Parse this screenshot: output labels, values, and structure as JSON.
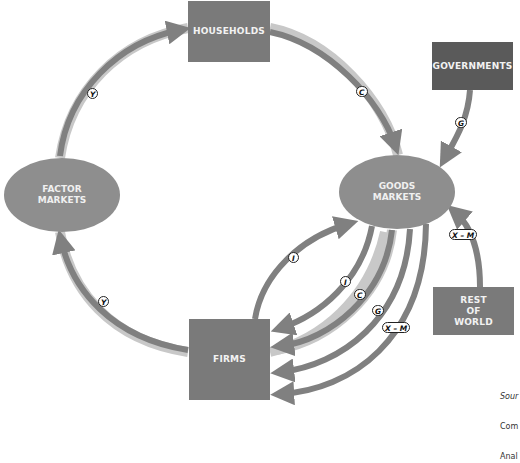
{
  "diagram": {
    "type": "circular-flow",
    "nodes": {
      "households": "HOUSEHOLDS",
      "governments": "GOVERNMENTS",
      "factor_markets": [
        "FACTOR",
        "MARKETS"
      ],
      "goods_markets": [
        "GOODS",
        "MARKETS"
      ],
      "firms": "FIRMS",
      "rest_of_world": [
        "REST",
        "OF",
        "WORLD"
      ]
    },
    "flow_labels": {
      "y_top": "Y",
      "y_bottom": "Y",
      "c_top": "C",
      "g_top": "G",
      "x_m_right": "X – M",
      "i_outer": "I",
      "i_inner": "I",
      "c_bottom": "C",
      "g_bottom": "G",
      "x_m_bottom": "X – M"
    },
    "source": {
      "line1": "Sour",
      "line2": "Com",
      "line3": "Anal"
    },
    "colors": {
      "box": "#7a7a7a",
      "box_dark": "#5a5a5a",
      "oval": "#8e8e8e",
      "arrow": "#808080",
      "arrow_halo": "#c8c8c8"
    }
  }
}
